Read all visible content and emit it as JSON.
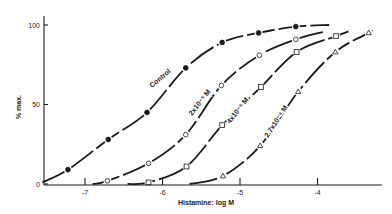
{
  "chart_data": {
    "type": "line",
    "title": "",
    "xlabel": "Histamine: log M",
    "ylabel": "% max.",
    "xlim": [
      -7.55,
      -3.15
    ],
    "ylim": [
      0,
      105
    ],
    "x_ticks": [
      -7,
      -6,
      -5,
      -4
    ],
    "x_tick_labels": [
      "-7",
      "-6",
      "-5",
      "-4"
    ],
    "y_ticks": [
      0,
      50,
      100
    ],
    "y_tick_labels": [
      "0",
      "50",
      "100"
    ],
    "grid": false,
    "legend": "inline labels along curves",
    "series": [
      {
        "name": "Control",
        "marker": "filled-circle",
        "label_text": "Control",
        "x": [
          -7.22,
          -6.7,
          -6.2,
          -5.7,
          -5.23,
          -4.76,
          -4.28
        ],
        "y": [
          9,
          28,
          45,
          73,
          89,
          95,
          99
        ]
      },
      {
        "name": "2x10-5 M",
        "marker": "open-circle",
        "label_text": "2x10⁻⁵ M",
        "x": [
          -6.71,
          -6.18,
          -5.7,
          -5.24,
          -4.75,
          -4.28
        ],
        "y": [
          2,
          13,
          31,
          62,
          81,
          91
        ]
      },
      {
        "name": "4x10-5 M",
        "marker": "open-square",
        "label_text": "4x10⁻⁵ M",
        "x": [
          -6.18,
          -5.69,
          -5.23,
          -4.73,
          -4.27,
          -3.76
        ],
        "y": [
          1,
          11,
          37,
          61,
          83,
          93
        ]
      },
      {
        "name": "2.7x10-4 M",
        "marker": "open-triangle",
        "label_text": "2.7x10⁻⁴ M",
        "x": [
          -5.22,
          -4.74,
          -4.25,
          -3.77,
          -3.34
        ],
        "y": [
          5,
          24,
          58,
          83,
          95
        ]
      }
    ]
  },
  "layout": {
    "plot_left": 44,
    "plot_right": 380,
    "y0_px": 184,
    "y100_px": 25,
    "x_minus7_px": 85,
    "px_per_log_unit": 77.5
  },
  "curve_labels": [
    {
      "text": "Control",
      "x": 152,
      "y": 88,
      "angle": -40
    },
    {
      "text": "2x10⁻⁵ M",
      "x": 192,
      "y": 116,
      "angle": -52
    },
    {
      "text": "4x10⁻⁵ M",
      "x": 230,
      "y": 124,
      "angle": -52
    },
    {
      "text": "2.7x10⁻⁴ M",
      "x": 268,
      "y": 138,
      "angle": -57
    }
  ]
}
